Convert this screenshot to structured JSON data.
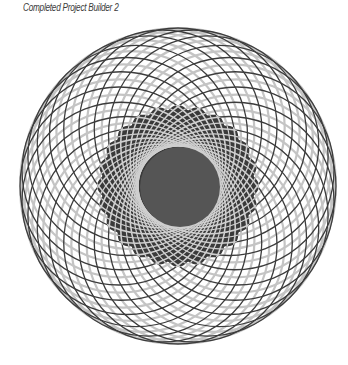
{
  "caption": "Completed Project Builder 2",
  "spirograph": {
    "center_x": 178,
    "center_y": 186,
    "circle_count": 24,
    "circle_radius": 99,
    "offset": 59,
    "inner_disk_radius": 40,
    "dark_ring_radius": 80,
    "colors": {
      "dark_line": "#3c3c3c",
      "light_line": "#c4c4c4",
      "inner_disk": "#555555",
      "dark_ring": "#3a3a3a",
      "ring_line": "#cfcfcf",
      "background": "#ffffff"
    }
  }
}
